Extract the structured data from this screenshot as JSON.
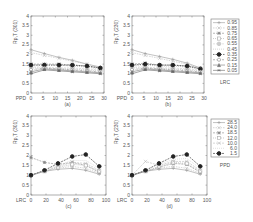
{
  "chart_data": [
    {
      "panel": "(a)",
      "type": "line",
      "ylabel": "Rp,T Rp,T(301)",
      "xlabel": "PPD",
      "x": [
        0,
        5.5,
        11.5,
        17,
        23,
        28.5
      ],
      "xticks": [
        0,
        5,
        10,
        15,
        20,
        25,
        30
      ],
      "yticks": [
        0,
        0.5,
        1,
        1.5,
        2,
        2.5,
        3,
        3.5,
        4
      ],
      "xlim": [
        0,
        30
      ],
      "ylim": [
        0,
        4
      ],
      "legend_title": "LRC",
      "series": [
        {
          "name": "0.95",
          "values": [
            2.25,
            2.05,
            1.85,
            1.7,
            1.5,
            1.35
          ]
        },
        {
          "name": "0.85",
          "values": [
            2.1,
            1.95,
            1.8,
            1.65,
            1.5,
            1.3
          ]
        },
        {
          "name": "0.75",
          "values": [
            1.5,
            1.5,
            1.5,
            1.45,
            1.4,
            1.3
          ]
        },
        {
          "name": "0.65",
          "values": [
            1.45,
            1.45,
            1.45,
            1.4,
            1.35,
            1.25
          ]
        },
        {
          "name": "0.55",
          "values": [
            1.35,
            1.35,
            1.3,
            1.3,
            1.25,
            1.2
          ]
        },
        {
          "name": "0.45",
          "values": [
            1.3,
            1.3,
            1.25,
            1.25,
            1.2,
            1.15
          ]
        },
        {
          "name": "0.35",
          "values": [
            1.45,
            1.45,
            1.45,
            1.45,
            1.4,
            1.3
          ]
        },
        {
          "name": "0.25",
          "values": [
            1.2,
            1.3,
            1.25,
            1.2,
            1.15,
            1.1
          ]
        },
        {
          "name": "0.15",
          "values": [
            1.1,
            1.25,
            1.2,
            1.15,
            1.1,
            1.05
          ]
        },
        {
          "name": "0.05",
          "values": [
            1.0,
            1.2,
            1.15,
            1.1,
            1.05,
            1.0
          ]
        }
      ]
    },
    {
      "panel": "(b)",
      "type": "line",
      "ylabel": "Rp,T Rp,T(230)",
      "xlabel": "PPD",
      "x": [
        0,
        5.5,
        11.5,
        17,
        23,
        28.5
      ],
      "xticks": [
        0,
        5,
        10,
        15,
        20,
        25,
        30
      ],
      "yticks": [
        0,
        0.5,
        1,
        1.5,
        2,
        2.5,
        3,
        3.5,
        4
      ],
      "xlim": [
        0,
        30
      ],
      "ylim": [
        0,
        4
      ],
      "legend_title": "LRC",
      "series": [
        {
          "name": "0.95",
          "values": [
            2.25,
            2.05,
            1.9,
            1.75,
            1.55,
            1.3
          ]
        },
        {
          "name": "0.85",
          "values": [
            2.1,
            1.95,
            1.8,
            1.65,
            1.5,
            1.25
          ]
        },
        {
          "name": "0.75",
          "values": [
            1.5,
            1.55,
            1.45,
            1.45,
            1.4,
            1.3
          ]
        },
        {
          "name": "0.65",
          "values": [
            1.45,
            1.45,
            1.4,
            1.4,
            1.35,
            1.25
          ]
        },
        {
          "name": "0.55",
          "values": [
            1.35,
            1.35,
            1.3,
            1.3,
            1.25,
            1.2
          ]
        },
        {
          "name": "0.45",
          "values": [
            1.3,
            1.3,
            1.25,
            1.25,
            1.2,
            1.15
          ]
        },
        {
          "name": "0.35",
          "values": [
            1.45,
            1.5,
            1.45,
            1.45,
            1.4,
            1.25
          ]
        },
        {
          "name": "0.25",
          "values": [
            1.2,
            1.3,
            1.25,
            1.2,
            1.15,
            1.1
          ]
        },
        {
          "name": "0.15",
          "values": [
            1.1,
            1.25,
            1.2,
            1.15,
            1.1,
            1.05
          ]
        },
        {
          "name": "0.05",
          "values": [
            1.0,
            1.2,
            1.15,
            1.1,
            1.05,
            1.0
          ]
        }
      ]
    },
    {
      "panel": "(c)",
      "type": "line",
      "ylabel": "Rp,T Rp,T(301)",
      "xlabel": "LRC",
      "x": [
        0,
        18,
        36,
        55,
        73,
        91
      ],
      "xticks": [
        0,
        20,
        40,
        60,
        80,
        100
      ],
      "yticks": [
        0,
        0.5,
        1,
        1.5,
        2,
        2.5,
        3,
        3.5,
        4
      ],
      "xlim": [
        0,
        100
      ],
      "ylim": [
        0,
        4
      ],
      "legend_title": "PPD",
      "series": [
        {
          "name": "28.5",
          "values": [
            1.0,
            1.2,
            1.3,
            1.35,
            1.25,
            1.05
          ]
        },
        {
          "name": "24.0",
          "values": [
            1.0,
            1.2,
            1.35,
            1.45,
            1.35,
            1.1
          ]
        },
        {
          "name": "18.5",
          "values": [
            1.9,
            1.65,
            1.55,
            1.65,
            1.5,
            1.15
          ]
        },
        {
          "name": "12.0",
          "values": [
            1.0,
            1.2,
            1.4,
            1.55,
            1.5,
            1.2
          ]
        },
        {
          "name": "10.0",
          "values": [
            1.0,
            1.2,
            1.45,
            1.65,
            1.6,
            1.25
          ]
        },
        {
          "name": "6.0",
          "values": [
            1.0,
            1.25,
            1.5,
            1.75,
            1.75,
            1.35
          ]
        },
        {
          "name": "1.5",
          "values": [
            1.0,
            1.25,
            1.6,
            1.95,
            2.05,
            1.45
          ]
        }
      ]
    },
    {
      "panel": "(d)",
      "type": "line",
      "ylabel": "Rp,T Rp,T(230)",
      "xlabel": "LRC",
      "x": [
        0,
        18,
        36,
        55,
        73,
        91
      ],
      "xticks": [
        0,
        20,
        40,
        60,
        80,
        100
      ],
      "yticks": [
        0,
        0.5,
        1,
        1.5,
        2,
        2.5,
        3,
        3.5,
        4
      ],
      "xlim": [
        0,
        100
      ],
      "ylim": [
        0,
        4
      ],
      "legend_title": "PPD",
      "series": [
        {
          "name": "28.5",
          "values": [
            1.0,
            1.2,
            1.3,
            1.35,
            1.25,
            1.05
          ]
        },
        {
          "name": "24.0",
          "values": [
            1.0,
            1.2,
            1.35,
            1.45,
            1.35,
            1.1
          ]
        },
        {
          "name": "18.5",
          "values": [
            1.0,
            1.2,
            1.4,
            1.6,
            1.55,
            1.15
          ]
        },
        {
          "name": "12.0",
          "values": [
            1.0,
            1.2,
            1.45,
            1.65,
            1.6,
            1.2
          ]
        },
        {
          "name": "10.0",
          "values": [
            1.0,
            1.7,
            1.5,
            1.7,
            1.7,
            1.25
          ]
        },
        {
          "name": "6.0",
          "values": [
            1.0,
            1.25,
            1.55,
            1.8,
            1.85,
            1.35
          ]
        },
        {
          "name": "1.5",
          "values": [
            1.0,
            1.25,
            1.6,
            1.95,
            2.05,
            1.45
          ]
        }
      ]
    }
  ],
  "panels": {
    "a": {
      "caption": "(a)",
      "ylabel": "Rp,T",
      "ysub": "(301)",
      "xlabel": "PPD"
    },
    "b": {
      "caption": "(b)",
      "ylabel": "Rp,T",
      "ysub": "(230)",
      "xlabel": "PPD"
    },
    "c": {
      "caption": "(c)",
      "ylabel": "Rp,T",
      "ysub": "(301)",
      "xlabel": "LRC"
    },
    "d": {
      "caption": "(d)",
      "ylabel": "Rp,T",
      "ysub": "(230)",
      "xlabel": "LRC"
    }
  },
  "legend_top": {
    "title": "LRC",
    "items": [
      "0.95",
      "0.85",
      "0.75",
      "0.65",
      "0.55",
      "0.45",
      "0.35",
      "0.25",
      "0.15",
      "0.05"
    ]
  },
  "legend_bottom": {
    "title": "PPD",
    "items": [
      "28.5",
      "24.0",
      "18.5",
      "12.0",
      "10.0",
      "6.0",
      "1.5"
    ]
  }
}
